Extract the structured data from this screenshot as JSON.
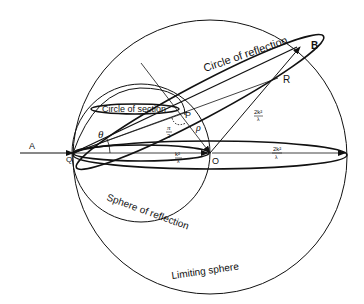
{
  "diagram": {
    "labels": {
      "circle_of_reflection": "Circle of reflection",
      "circle_of_section": "Circle of section",
      "sphere_of_reflection": "Sphere of reflection",
      "limiting_sphere": "Limiting sphere"
    },
    "points": {
      "A": "A",
      "B": "B",
      "Q": "Q",
      "O": "O",
      "P": "P",
      "R": "R"
    },
    "symbols": {
      "theta": "θ",
      "rho": "ρ",
      "pi_over_2_num": "π",
      "pi_over_2_den": "2",
      "k2_lambda_num": "k²",
      "k2_lambda_den": "λ",
      "two_k2_lambda_num": "2k²",
      "two_k2_lambda_den": "λ",
      "two_k2_lambda_num_b": "2k²",
      "two_k2_lambda_den_b": "λ"
    },
    "colors": {
      "ink": "#111111",
      "background": "#ffffff"
    }
  }
}
